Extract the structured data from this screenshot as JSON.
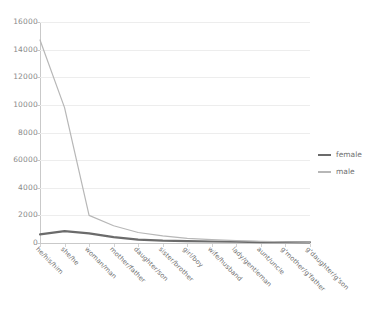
{
  "chart_data": {
    "type": "line",
    "title": "",
    "xlabel": "",
    "ylabel": "",
    "ylim": [
      0,
      16000
    ],
    "ytick_step": 2000,
    "grid": true,
    "legend_position": "right",
    "categories": [
      "he/his/him",
      "she/he",
      "woman/man",
      "mother/father",
      "daughter/son",
      "sister/brother",
      "girl/boy",
      "wife/husband",
      "lady/gentleman",
      "aunt/uncle",
      "g'mother/g'father",
      "g'daughter/g'son"
    ],
    "ytick_labels": [
      "16000",
      "14000",
      "12000",
      "10000",
      "8000",
      "60000",
      "4000",
      "2000",
      "0"
    ],
    "ytick_values": [
      16000,
      14000,
      12000,
      10000,
      8000,
      6000,
      4000,
      2000,
      0
    ],
    "series": [
      {
        "name": "female",
        "color": "#6b6b6b",
        "width": 2.2,
        "values": [
          620,
          860,
          700,
          420,
          250,
          170,
          130,
          110,
          90,
          70,
          60,
          50
        ]
      },
      {
        "name": "male",
        "color": "#b7b7b7",
        "width": 1.2,
        "values": [
          14700,
          9800,
          2000,
          1250,
          760,
          520,
          330,
          240,
          170,
          120,
          90,
          70
        ]
      }
    ]
  },
  "legend": {
    "items": [
      {
        "label": "female"
      },
      {
        "label": "male"
      }
    ]
  }
}
